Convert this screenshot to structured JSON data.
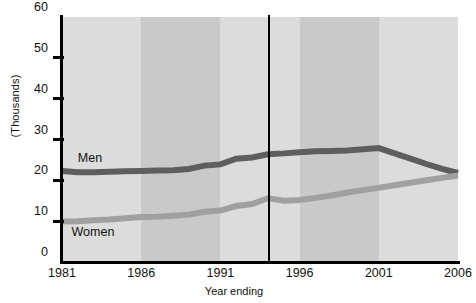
{
  "chart_data": {
    "type": "line",
    "title": "",
    "xlabel": "Year ending",
    "ylabel": "(Thousands)",
    "xlim": [
      1981,
      2006
    ],
    "ylim": [
      0,
      60
    ],
    "x_ticks": [
      1981,
      1986,
      1991,
      1996,
      2001,
      2006
    ],
    "y_ticks": [
      0,
      10,
      20,
      30,
      40,
      50,
      60
    ],
    "grid": false,
    "legend_position": "inline-annotation",
    "background_bands": [
      {
        "from": 1981,
        "to": 1986,
        "shade": "light"
      },
      {
        "from": 1986,
        "to": 1991,
        "shade": "dark"
      },
      {
        "from": 1991,
        "to": 1996,
        "shade": "light"
      },
      {
        "from": 1996,
        "to": 2001,
        "shade": "dark"
      },
      {
        "from": 2001,
        "to": 2006,
        "shade": "light"
      }
    ],
    "reference_line": {
      "x": 1994,
      "color": "#000000"
    },
    "x": [
      1981,
      1982,
      1983,
      1984,
      1985,
      1986,
      1987,
      1988,
      1989,
      1990,
      1991,
      1992,
      1993,
      1994,
      1995,
      1996,
      1997,
      1998,
      1999,
      2000,
      2001,
      2002,
      2003,
      2004,
      2005,
      2006
    ],
    "series": [
      {
        "name": "Men",
        "color": "#5e5e5e",
        "label": "Men",
        "values": [
          22.3,
          22.0,
          22.0,
          22.1,
          22.2,
          22.3,
          22.4,
          22.5,
          22.8,
          23.6,
          23.9,
          25.3,
          25.6,
          26.4,
          26.6,
          26.9,
          27.1,
          27.2,
          27.3,
          27.6,
          27.9,
          26.6,
          25.3,
          24.0,
          22.8,
          21.8
        ]
      },
      {
        "name": "Women",
        "color": "#a0a0a0",
        "label": "Women",
        "values": [
          9.9,
          10.0,
          10.2,
          10.4,
          10.7,
          11.0,
          11.1,
          11.3,
          11.6,
          12.3,
          12.6,
          13.7,
          14.2,
          15.6,
          15.0,
          15.2,
          15.7,
          16.3,
          17.0,
          17.6,
          18.2,
          18.8,
          19.4,
          20.0,
          20.6,
          21.2
        ]
      }
    ],
    "annotations": [
      {
        "text": "Men",
        "x": 1982.0,
        "y": 25.3
      },
      {
        "text": "Women",
        "x": 1981.6,
        "y": 7.2
      }
    ],
    "colors": {
      "band_light": "#dcdcdc",
      "band_dark": "#c9c9c9",
      "axis": "#000000",
      "men": "#5e5e5e",
      "women": "#a0a0a0",
      "text": "#111111",
      "background": "#ffffff"
    }
  }
}
